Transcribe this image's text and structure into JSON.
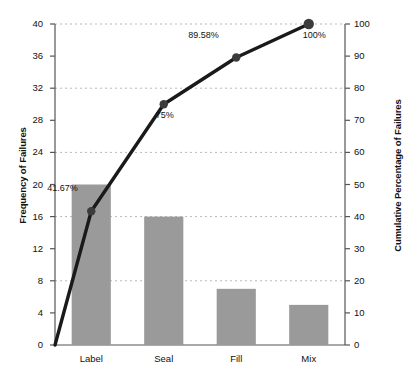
{
  "chart_data": {
    "type": "bar",
    "subtype": "pareto",
    "title": "",
    "categories": [
      "Label",
      "Seal",
      "Fill",
      "Mix"
    ],
    "values": [
      20,
      16,
      7,
      5
    ],
    "series": [
      {
        "name": "Frequency of Failures",
        "type": "bar",
        "axis": "left",
        "values": [
          20,
          16,
          7,
          5
        ]
      },
      {
        "name": "Cumulative Percentage of Failures",
        "type": "line",
        "axis": "right",
        "values": [
          41.67,
          75,
          89.58,
          100
        ]
      }
    ],
    "point_labels": [
      "41.67%",
      "75%",
      "89.58%",
      "100%"
    ],
    "origin_value": 0,
    "xlabel": "",
    "ylabel": "Frequency of Failures",
    "y2label": "Cumulative Percentage of Failures",
    "ylim": [
      0,
      40
    ],
    "y2lim": [
      0,
      100
    ],
    "yticks": [
      0,
      4,
      8,
      12,
      16,
      20,
      24,
      28,
      32,
      36,
      40
    ],
    "y2ticks": [
      0,
      10,
      20,
      30,
      40,
      50,
      60,
      70,
      80,
      90,
      100
    ],
    "ytick_labels": [
      "0",
      "4",
      "8",
      "12",
      "16",
      "20",
      "24",
      "28",
      "32",
      "36",
      "40"
    ],
    "y2tick_labels": [
      "0",
      "10",
      "20",
      "30",
      "40",
      "50",
      "60",
      "70",
      "80",
      "90",
      "100"
    ],
    "gridlines": [
      8,
      16,
      24,
      32,
      40
    ],
    "grid": true,
    "legend": "none",
    "colors": {
      "bar_fill": "#9a9a9a",
      "line": "#1a1a1a",
      "marker": "#3c3c3c",
      "grid": "#b9b9b9",
      "axis": "#555555",
      "text": "#111111",
      "background": "#ffffff"
    }
  }
}
